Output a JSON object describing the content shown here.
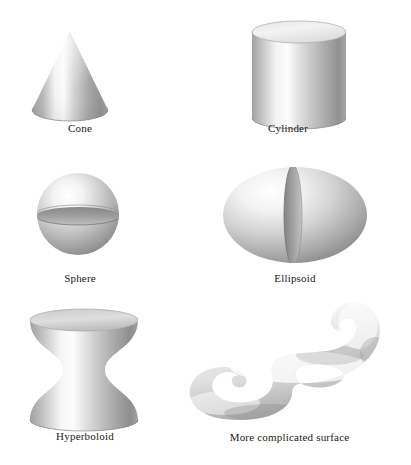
{
  "figure": {
    "background_color": "#ffffff",
    "caption_color": "#222020"
  },
  "shapes": [
    {
      "id": "cone",
      "label": "Cone",
      "type": "cone",
      "geometry": {
        "apex_x": 70,
        "apex_y": 32,
        "base_center_x": 70,
        "base_center_y": 110,
        "base_rx": 38,
        "base_ry": 11
      },
      "colors": {
        "light": "#fdfdfd",
        "mid": "#b9b9b9",
        "dark": "#8e8e8e",
        "base_dark": "#9a9a9a"
      }
    },
    {
      "id": "cylinder",
      "label": "Cylinder",
      "type": "cylinder",
      "geometry": {
        "center_x": 299,
        "top_y": 32,
        "bottom_y": 118,
        "rx": 47,
        "ry": 11
      },
      "colors": {
        "light": "#fdfdfd",
        "mid": "#bdbdbd",
        "dark": "#8f8f8f",
        "top_fill": "#eeeeee",
        "base_dark": "#9b9b9b"
      }
    },
    {
      "id": "sphere",
      "label": "Sphere",
      "type": "sphere",
      "geometry": {
        "center_x": 78,
        "center_y": 214,
        "r": 41,
        "seam_y": 215,
        "seam_ry": 9
      },
      "colors": {
        "light": "#ffffff",
        "mid": "#c4c4c4",
        "dark": "#8a8a8a",
        "seam": "#8d8d8d"
      }
    },
    {
      "id": "ellipsoid",
      "label": "Ellipsoid",
      "type": "ellipsoid",
      "geometry": {
        "center_x": 295,
        "center_y": 215,
        "rx": 72,
        "ry": 48,
        "seam_x": 293,
        "seam_rx": 9
      },
      "colors": {
        "light": "#ffffff",
        "mid": "#c8c8c8",
        "dark": "#8d8d8d",
        "seam": "#8b8b8b"
      }
    },
    {
      "id": "hyperboloid",
      "label": "Hyperboloid",
      "type": "hyperboloid",
      "geometry": {
        "center_x": 84,
        "top_y": 320,
        "bottom_y": 420,
        "rx": 54,
        "ry": 11,
        "waist_rx": 21
      },
      "colors": {
        "light": "#ffffff",
        "mid": "#c0c0c0",
        "dark": "#8b8b8b",
        "top_fill": "#d8d8d8",
        "base_dark": "#9a9a9a"
      }
    },
    {
      "id": "complicated-surface",
      "label": "More complicated surface",
      "type": "blob",
      "geometry": {
        "bbox_x": 190,
        "bbox_y": 300,
        "bbox_w": 195,
        "bbox_h": 128
      },
      "colors": {
        "light": "#ffffff",
        "mid": "#d3d3d3",
        "dark": "#9a9a9a"
      }
    }
  ],
  "captions": {
    "cone": "Cone",
    "cylinder": "Cylinder",
    "sphere": "Sphere",
    "ellipsoid": "Ellipsoid",
    "hyperboloid": "Hyperboloid",
    "complicated": "More complicated surface"
  }
}
